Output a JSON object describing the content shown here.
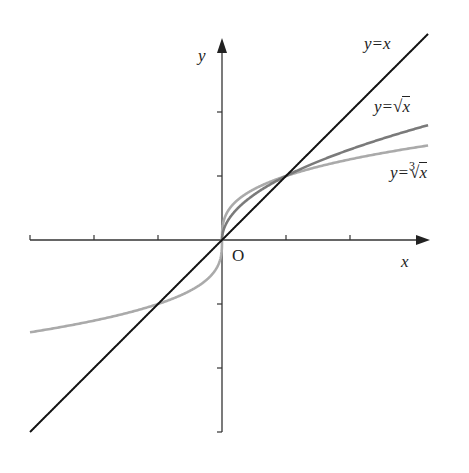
{
  "chart_data": {
    "type": "line",
    "title": "",
    "xlabel": "x",
    "ylabel": "y",
    "origin_label": "O",
    "xlim": [
      -3,
      3.22
    ],
    "ylim": [
      -3,
      3
    ],
    "x_ticks": [
      -3,
      -2,
      -1,
      1,
      2
    ],
    "y_ticks": [
      -3,
      -2,
      -1,
      1,
      2
    ],
    "grid": false,
    "legend": "inline labels at curve ends",
    "series": [
      {
        "name": "y=x",
        "function": "x",
        "color": "#111111",
        "domain": [
          -3,
          3.22
        ]
      },
      {
        "name": "y=√x",
        "function": "sqrt(x)",
        "color": "#7a7a7a",
        "domain": [
          0,
          3.22
        ]
      },
      {
        "name": "y=∛x",
        "function": "cbrt(x)",
        "color": "#aaaaaa",
        "domain": [
          -3,
          3.22
        ]
      }
    ],
    "intersections": [
      [
        -1,
        -1
      ],
      [
        0,
        0
      ],
      [
        1,
        1
      ]
    ]
  },
  "labels": {
    "y_axis": "y",
    "x_axis": "x",
    "origin": "O",
    "line": "y=x",
    "sqrt_prefix": "y=",
    "sqrt_radicand": "x",
    "cbrt_prefix": "y=",
    "cbrt_index": "3",
    "cbrt_radicand": "x"
  }
}
